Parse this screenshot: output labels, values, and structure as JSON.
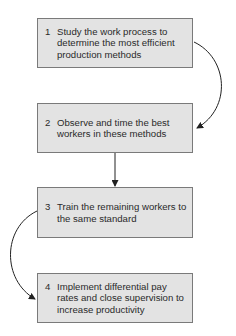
{
  "diagram": {
    "type": "flowchart",
    "colors": {
      "box_fill": "#e3e3e3",
      "box_border": "#7a7a7a",
      "text": "#2a2a2a",
      "arrow": "#222222"
    },
    "steps": [
      {
        "number": "1",
        "text": "Study the work process to determine the most efficient production methods"
      },
      {
        "number": "2",
        "text": "Observe and time the best workers in these methods"
      },
      {
        "number": "3",
        "text": "Train the remaining workers to the same standard"
      },
      {
        "number": "4",
        "text": "Implement differential pay rates and close supervision to increase productivity"
      }
    ],
    "connections": [
      {
        "from": "1",
        "to": "2",
        "style": "curved-right"
      },
      {
        "from": "2",
        "to": "3",
        "style": "straight-down"
      },
      {
        "from": "3",
        "to": "4",
        "style": "curved-left"
      }
    ]
  }
}
